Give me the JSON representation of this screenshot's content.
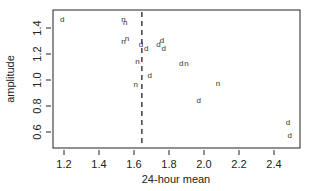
{
  "chart_data": {
    "type": "scatter",
    "title": "",
    "xlabel": "24-hour mean",
    "ylabel": "amplitude",
    "xlim": [
      1.15,
      2.52
    ],
    "ylim": [
      0.53,
      1.55
    ],
    "xticks": [
      1.2,
      1.4,
      1.6,
      1.8,
      2.0,
      2.2,
      2.4
    ],
    "xtick_labels": [
      "1.2",
      "1.4",
      "1.6",
      "1.8",
      "2.0",
      "2.2",
      "2.4"
    ],
    "yticks": [
      0.6,
      0.8,
      1.0,
      1.2,
      1.4
    ],
    "ytick_labels": [
      "0.6",
      "0.8",
      "1.0",
      "1.2",
      "1.4"
    ],
    "grid": false,
    "legend": null,
    "marker_style": "text labels 'd' and 'n'",
    "reference_line": {
      "orientation": "vertical",
      "x": 1.645,
      "style": "dashed"
    },
    "points": [
      {
        "label": "d",
        "x": 1.19,
        "y": 1.47
      },
      {
        "label": "n",
        "x": 1.54,
        "y": 1.47
      },
      {
        "label": "n",
        "x": 1.55,
        "y": 1.45
      },
      {
        "label": "n",
        "x": 1.54,
        "y": 1.3
      },
      {
        "label": "n",
        "x": 1.56,
        "y": 1.32
      },
      {
        "label": "d",
        "x": 1.64,
        "y": 1.28
      },
      {
        "label": "d",
        "x": 1.67,
        "y": 1.25
      },
      {
        "label": "d",
        "x": 1.74,
        "y": 1.28
      },
      {
        "label": "d",
        "x": 1.76,
        "y": 1.31
      },
      {
        "label": "d",
        "x": 1.77,
        "y": 1.25
      },
      {
        "label": "n",
        "x": 1.62,
        "y": 1.15
      },
      {
        "label": "d",
        "x": 1.69,
        "y": 1.04
      },
      {
        "label": "d",
        "x": 1.87,
        "y": 1.13
      },
      {
        "label": "n",
        "x": 1.9,
        "y": 1.13
      },
      {
        "label": "n",
        "x": 1.61,
        "y": 0.97
      },
      {
        "label": "n",
        "x": 2.08,
        "y": 0.98
      },
      {
        "label": "d",
        "x": 1.97,
        "y": 0.85
      },
      {
        "label": "d",
        "x": 2.48,
        "y": 0.68
      },
      {
        "label": "d",
        "x": 2.49,
        "y": 0.58
      }
    ]
  }
}
